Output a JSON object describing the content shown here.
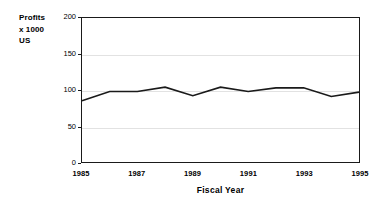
{
  "chart_data": {
    "type": "line",
    "title": "",
    "xlabel": "Fiscal Year",
    "ylabel": "Profits x 1000 US",
    "ylabel_lines": [
      "Profits",
      "x 1000",
      "US"
    ],
    "x": [
      1985,
      1986,
      1987,
      1988,
      1989,
      1990,
      1991,
      1992,
      1993,
      1994,
      1995
    ],
    "values": [
      85,
      98,
      98,
      104,
      92,
      104,
      98,
      103,
      103,
      91,
      97
    ],
    "series": [
      {
        "name": "Profits",
        "values": [
          85,
          98,
          98,
          104,
          92,
          104,
          98,
          103,
          103,
          91,
          97
        ]
      }
    ],
    "xlim": [
      1985,
      1995
    ],
    "ylim": [
      0,
      200
    ],
    "ytick_labels": [
      "0",
      "50",
      "100",
      "150",
      "200"
    ],
    "ytick_values": [
      0,
      50,
      100,
      150,
      200
    ],
    "xtick_labels": [
      "1985",
      "1987",
      "1989",
      "1991",
      "1993",
      "1995"
    ],
    "xtick_values": [
      1985,
      1987,
      1989,
      1991,
      1993,
      1995
    ],
    "grid": "horizontal",
    "legend": "none",
    "line_color": "#1a1a1a",
    "grid_color": "#e2e2e2",
    "frame_color": "#1a1a1a",
    "background_color": "#ffffff"
  }
}
